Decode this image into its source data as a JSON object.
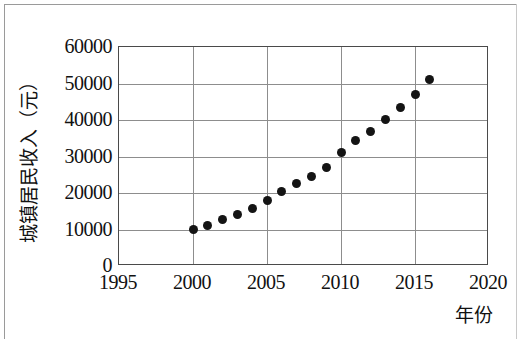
{
  "chart_data": {
    "type": "scatter",
    "title": "",
    "xlabel": "年份",
    "ylabel": "城镇居民收入（元）",
    "xlim": [
      1995,
      2020
    ],
    "ylim": [
      0,
      60000
    ],
    "grid": true,
    "legend": null,
    "x_ticks": [
      "1995",
      "2000",
      "2005",
      "2010",
      "2015",
      "2020"
    ],
    "x_tick_values": [
      1995,
      2000,
      2005,
      2010,
      2015,
      2020
    ],
    "y_ticks": [
      "0",
      "10000",
      "20000",
      "30000",
      "40000",
      "50000",
      "60000"
    ],
    "y_tick_values": [
      0,
      10000,
      20000,
      30000,
      40000,
      50000,
      60000
    ],
    "series": [
      {
        "name": "城镇居民收入",
        "marker": "filled-circle",
        "color": "#141414",
        "x": [
          2000,
          2001,
          2002,
          2003,
          2004,
          2005,
          2006,
          2007,
          2008,
          2009,
          2010,
          2011,
          2012,
          2013,
          2014,
          2015,
          2016
        ],
        "values": [
          10000,
          11200,
          12800,
          14000,
          15700,
          18000,
          20300,
          22600,
          24400,
          27000,
          31000,
          34400,
          36900,
          40200,
          43400,
          47000,
          51000
        ]
      }
    ]
  },
  "axes": {
    "y_label": "城镇居民收入（元）",
    "x_label": "年份"
  }
}
